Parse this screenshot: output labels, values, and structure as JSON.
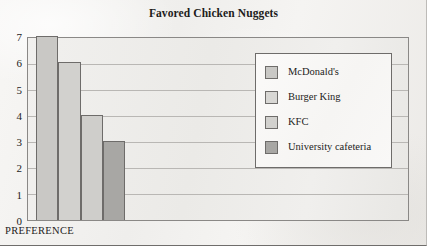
{
  "chart_data": {
    "type": "bar",
    "title": "Favored Chicken Nuggets",
    "xlabel": "PREFERENCE",
    "ylabel": "",
    "ylim": [
      0,
      7
    ],
    "yticks": [
      "7",
      "6",
      "5",
      "4",
      "3",
      "2",
      "1",
      "0"
    ],
    "grid": true,
    "legend_position": "inside-right",
    "categories": [
      "McDonald's",
      "Burger King",
      "KFC",
      "University cafeteria"
    ],
    "values": [
      7,
      6,
      4,
      3
    ],
    "bar_colors": [
      "#c9c8c5",
      "#d2d1ce",
      "#cfcecb",
      "#a8a7a4"
    ]
  },
  "legend": {
    "entries": [
      {
        "label": "McDonald's",
        "color": "#c9c8c5"
      },
      {
        "label": "Burger King",
        "color": "#d8d7d4"
      },
      {
        "label": "KFC",
        "color": "#d2d1ce"
      },
      {
        "label": "University cafeteria",
        "color": "#a8a7a4"
      }
    ]
  },
  "colors": {
    "axis": "#8a8886",
    "gridline": "#b9b7b4",
    "bar_border": "#6e6c6a",
    "text": "#1d1c1b",
    "plot_background": "#ecebe8",
    "page_background": "#f2f1ef"
  }
}
